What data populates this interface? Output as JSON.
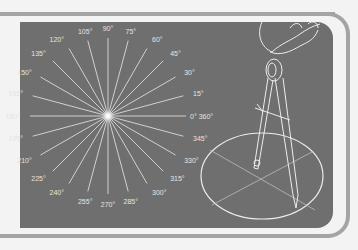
{
  "figure": {
    "colors": {
      "background": "#f3f3f3",
      "panel": "#6f6f6f",
      "frame": "#a4a4a4",
      "lines": "#e8e8e8"
    },
    "wheel": {
      "center": [
        108,
        116
      ],
      "label_radius": 88,
      "step_degrees": 15,
      "labels": [
        "0° 360°",
        "15°",
        "30°",
        "45°",
        "60°",
        "75°",
        "90°",
        "105°",
        "120°",
        "135°",
        "150°",
        "165°",
        "180°",
        "195°",
        "210°",
        "225°",
        "240°",
        "255°",
        "270°",
        "285°",
        "300°",
        "315°",
        "330°",
        "345°"
      ]
    },
    "compass_tool": {
      "circle_center": [
        262,
        174
      ],
      "circle_rx": 60,
      "circle_ry": 40
    }
  }
}
